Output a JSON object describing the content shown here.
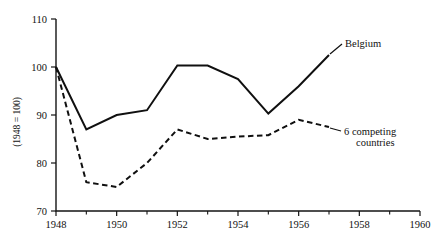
{
  "chart_data": {
    "type": "line",
    "title": "",
    "subtitle": "",
    "xlabel": "",
    "ylabel": "(1948 = 100)",
    "xlim": [
      1948,
      1960
    ],
    "ylim": [
      70,
      110
    ],
    "grid": false,
    "legend_position": "inline-annotations",
    "x_ticks": [
      1948,
      1950,
      1952,
      1954,
      1956,
      1958,
      1960
    ],
    "x_tick_labels": [
      "1948",
      "1950",
      "1952",
      "1954",
      "1956",
      "1958",
      "1960"
    ],
    "x_minor_ticks": [
      1949,
      1951,
      1953,
      1955,
      1957,
      1959
    ],
    "y_ticks": [
      70,
      80,
      90,
      100,
      110
    ],
    "y_tick_labels": [
      "70",
      "80",
      "90",
      "100",
      "110"
    ],
    "x": [
      1948,
      1949,
      1950,
      1951,
      1952,
      1953,
      1954,
      1955,
      1956,
      1957
    ],
    "series": [
      {
        "name": "Belgium",
        "style": "solid",
        "color": "#101010",
        "values": [
          100,
          87,
          90,
          91,
          100.3,
          100.3,
          97.5,
          90.3,
          96,
          102.5
        ]
      },
      {
        "name": "6 competing countries",
        "style": "dashed",
        "color": "#101010",
        "values": [
          100,
          76,
          75,
          80,
          87,
          85,
          85.5,
          85.8,
          89,
          87.5
        ]
      }
    ],
    "annotations": [
      {
        "text": "Belgium",
        "line1": "Belgium",
        "line2": "",
        "at_x": 1957,
        "at_y": 102.5
      },
      {
        "text": "6 competing countries",
        "line1": "6 competing",
        "line2": "countries",
        "at_x": 1957,
        "at_y": 87.5
      }
    ]
  }
}
